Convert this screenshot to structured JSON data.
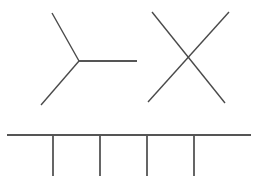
{
  "canvas": {
    "width": 258,
    "height": 188,
    "background_color": "#ffffff",
    "description": "Plain white drawing canvas containing three black line-drawn figures"
  },
  "style": {
    "stroke_color": "#555555",
    "stroke_color_dark": "#4a4a4a",
    "stroke_width": 1.4,
    "stroke_width_thick": 1.8
  },
  "figures": [
    {
      "id": "y-shape",
      "name": "Y junction figure",
      "label": "Y-shape",
      "vertex": {
        "x": 79,
        "y": 61
      },
      "segments": [
        {
          "name": "upper-left-arm",
          "x1": 52,
          "y1": 13,
          "x2": 79,
          "y2": 61
        },
        {
          "name": "lower-left-arm",
          "x1": 41,
          "y1": 105,
          "x2": 79,
          "y2": 61
        },
        {
          "name": "horizontal-arm",
          "x1": 79,
          "y1": 61,
          "x2": 137,
          "y2": 61
        }
      ]
    },
    {
      "id": "x-shape",
      "name": "X cross figure",
      "label": "X-shape",
      "crossing": {
        "x": 190,
        "y": 58
      },
      "segments": [
        {
          "name": "down-right-diagonal",
          "x1": 152,
          "y1": 12,
          "x2": 225,
          "y2": 103
        },
        {
          "name": "up-right-diagonal",
          "x1": 148,
          "y1": 102,
          "x2": 229,
          "y2": 12
        }
      ]
    },
    {
      "id": "comb-shape",
      "name": "Comb or rake figure",
      "label": "Comb-shape",
      "segments": [
        {
          "name": "horizontal-bar",
          "x1": 7,
          "y1": 135,
          "x2": 251,
          "y2": 135
        },
        {
          "name": "tine-1",
          "x1": 53,
          "y1": 135,
          "x2": 53,
          "y2": 176
        },
        {
          "name": "tine-2",
          "x1": 100,
          "y1": 135,
          "x2": 100,
          "y2": 176
        },
        {
          "name": "tine-3",
          "x1": 147,
          "y1": 135,
          "x2": 147,
          "y2": 176
        },
        {
          "name": "tine-4",
          "x1": 194,
          "y1": 135,
          "x2": 194,
          "y2": 176
        }
      ],
      "tine_count": 4
    }
  ]
}
